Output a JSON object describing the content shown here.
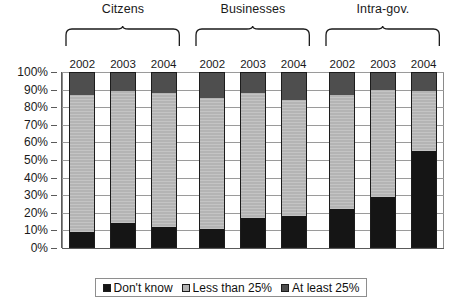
{
  "chart_data": {
    "type": "bar",
    "subtype": "stacked-100-percent",
    "title": "",
    "xlabel": "",
    "ylabel": "",
    "ylim": [
      0,
      100
    ],
    "ytick_labels": [
      "0%",
      "10%",
      "20%",
      "30%",
      "40%",
      "50%",
      "60%",
      "70%",
      "80%",
      "90%",
      "100%"
    ],
    "ytick_values": [
      0,
      10,
      20,
      30,
      40,
      50,
      60,
      70,
      80,
      90,
      100
    ],
    "grid": true,
    "legend_position": "bottom",
    "categories": [
      "2002",
      "2003",
      "2004",
      "2002",
      "2003",
      "2004",
      "2002",
      "2003",
      "2004"
    ],
    "groups": [
      {
        "label": "Citzens",
        "years": [
          "2002",
          "2003",
          "2004"
        ],
        "bars": [
          {
            "year": "2002",
            "dont_know": 9,
            "less_than_25": 78,
            "at_least_25": 13
          },
          {
            "year": "2003",
            "dont_know": 14,
            "less_than_25": 75,
            "at_least_25": 11
          },
          {
            "year": "2004",
            "dont_know": 12,
            "less_than_25": 76,
            "at_least_25": 12
          }
        ]
      },
      {
        "label": "Businesses",
        "years": [
          "2002",
          "2003",
          "2004"
        ],
        "bars": [
          {
            "year": "2002",
            "dont_know": 11,
            "less_than_25": 74,
            "at_least_25": 15
          },
          {
            "year": "2003",
            "dont_know": 17,
            "less_than_25": 71,
            "at_least_25": 12
          },
          {
            "year": "2004",
            "dont_know": 18,
            "less_than_25": 66,
            "at_least_25": 16
          }
        ]
      },
      {
        "label": "Intra-gov.",
        "years": [
          "2002",
          "2003",
          "2004"
        ],
        "bars": [
          {
            "year": "2002",
            "dont_know": 22,
            "less_than_25": 65,
            "at_least_25": 13
          },
          {
            "year": "2003",
            "dont_know": 29,
            "less_than_25": 61,
            "at_least_25": 10
          },
          {
            "year": "2004",
            "dont_know": 55,
            "less_than_25": 34,
            "at_least_25": 11
          }
        ]
      }
    ],
    "series": [
      {
        "name": "Don't know",
        "key": "dont_know",
        "color": "#151515",
        "values": [
          9,
          14,
          12,
          11,
          17,
          18,
          22,
          29,
          55
        ]
      },
      {
        "name": "Less than 25%",
        "key": "less_than_25",
        "color": "#b4b4b4",
        "values": [
          78,
          75,
          76,
          74,
          71,
          66,
          65,
          61,
          34
        ]
      },
      {
        "name": "At least 25%",
        "key": "at_least_25",
        "color": "#4e4e4e",
        "values": [
          13,
          11,
          12,
          15,
          12,
          16,
          13,
          10,
          11
        ]
      }
    ]
  },
  "legend": {
    "items": [
      {
        "label": "Don't know",
        "swatch": "s-dontknow"
      },
      {
        "label": "Less than 25%",
        "swatch": "s-lessthan"
      },
      {
        "label": "At least 25%",
        "swatch": "s-atleast"
      }
    ]
  }
}
